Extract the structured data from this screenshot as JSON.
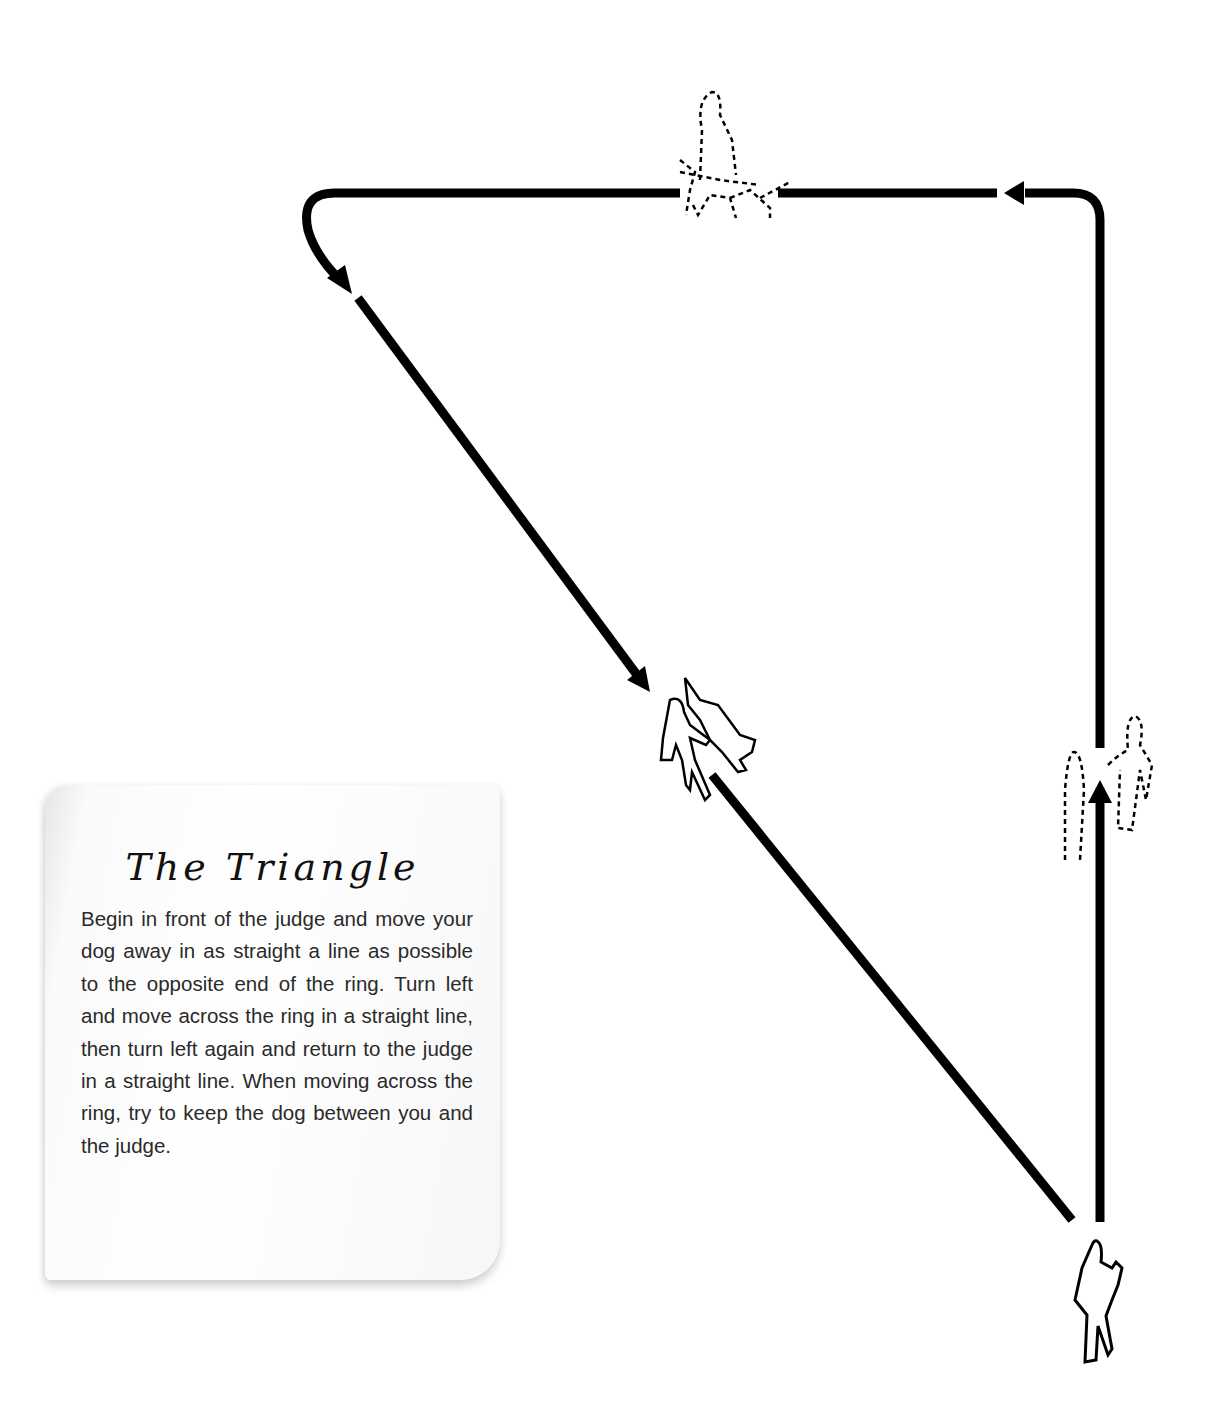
{
  "note": {
    "title": "The Triangle",
    "body": "Begin in front of the judge and move your dog away in as straight a line as possible to the opposite end of the ring. Turn left and move across the ring in a straight line, then turn left again and return to the judge in a straight line. When moving across the ring, try to keep the dog between you and the judge."
  },
  "diagram": {
    "stroke_color": "#000000",
    "background": "#ffffff",
    "figures": [
      {
        "name": "judge",
        "style": "solid-outline",
        "position": "bottom-right"
      },
      {
        "name": "handler-with-dog-walking-away",
        "style": "dashed-outline",
        "position": "right-side"
      },
      {
        "name": "handler-with-dog-crossing",
        "style": "dashed-outline",
        "position": "top"
      },
      {
        "name": "handler-with-dog-returning",
        "style": "solid-outline",
        "position": "center"
      }
    ],
    "path": [
      "up the right side",
      "left across the top",
      "diagonal back to the judge"
    ]
  }
}
